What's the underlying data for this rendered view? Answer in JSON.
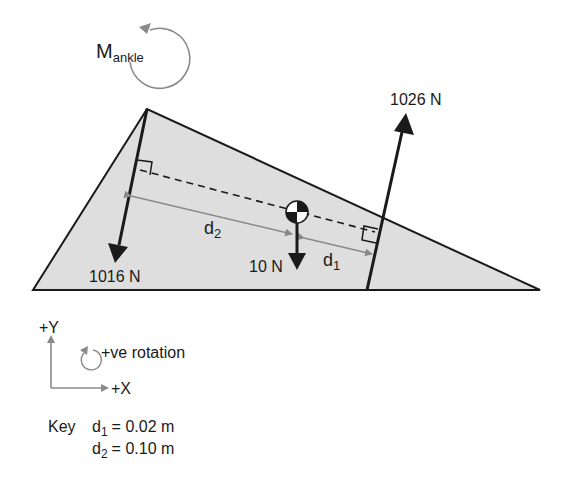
{
  "moment": {
    "symbol": "M",
    "subscript": "ankle"
  },
  "forces": {
    "upward": {
      "label": "1026 N"
    },
    "downward_left": {
      "label": "1016 N"
    },
    "weight": {
      "label": "10 N"
    }
  },
  "distances": {
    "d1": {
      "symbol": "d",
      "subscript": "1"
    },
    "d2": {
      "symbol": "d",
      "subscript": "2"
    }
  },
  "axes": {
    "y_label": "+Y",
    "x_label": "+X",
    "rotation_label": "+ve rotation"
  },
  "key": {
    "title": "Key",
    "entries": [
      {
        "symbol": "d",
        "subscript": "1",
        "value": "= 0.02 m"
      },
      {
        "symbol": "d",
        "subscript": "2",
        "value": "= 0.10 m"
      }
    ]
  },
  "colors": {
    "shape_fill": "#dedede",
    "line": "#1a1a1a",
    "grey_arrow": "#8a8a8a"
  }
}
